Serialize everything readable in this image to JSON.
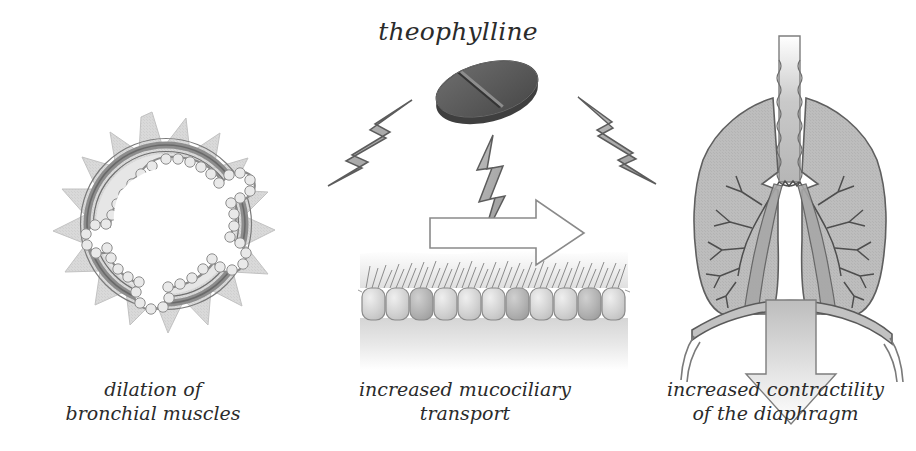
{
  "diagram": {
    "drug_name": "theophylline",
    "panels": [
      {
        "id": "bronchus",
        "caption": "dilation of\nbronchial muscles",
        "icon": "bronchus-cross-section"
      },
      {
        "id": "mucociliary",
        "caption": "increased mucociliary\ntransport",
        "icon": "ciliated-epithelium"
      },
      {
        "id": "diaphragm",
        "caption": "increased contractility\nof the diaphragm",
        "icon": "lungs-and-diaphragm"
      }
    ],
    "symbols": {
      "pill": "theophylline-tablet",
      "bolt_left": "lightning-bolt-left",
      "bolt_center": "lightning-bolt-center",
      "bolt_right": "lightning-bolt-right",
      "arrow_mid": "right-arrow-outline",
      "arrow_right": "down-arrow-gradient"
    },
    "colors": {
      "background": "#ffffff",
      "text": "#2b2b2b",
      "tissue_light": "#d9d9d9",
      "tissue_mid": "#b9b9b9",
      "tissue_dark": "#8f8f8f",
      "pill_dark": "#5a5a5a",
      "pill_edge": "#3c3c3c",
      "outline": "#6e6e6e",
      "bolt_fill": "#a9a9a9"
    }
  }
}
